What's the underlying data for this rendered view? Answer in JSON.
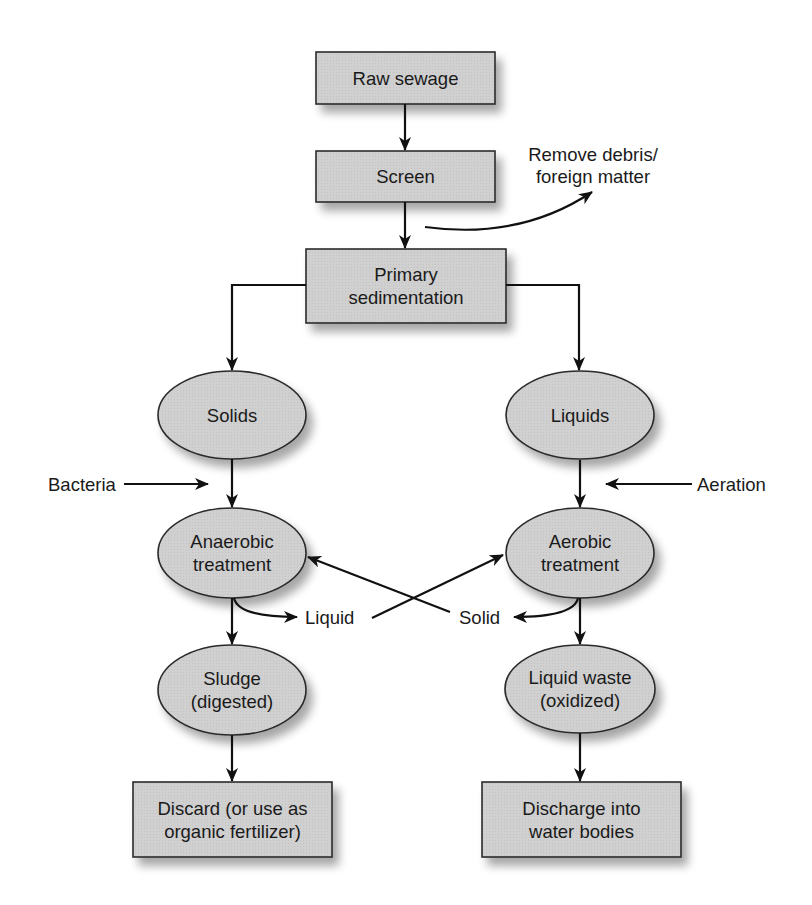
{
  "diagram": {
    "type": "flowchart",
    "title": "",
    "colors": {
      "node_fill": "#cfcfcf",
      "node_stroke": "#2a2a2a",
      "arrow": "#111111",
      "text": "#1a1a1a"
    },
    "nodes": {
      "raw_sewage": {
        "shape": "rect",
        "lines": [
          "Raw sewage"
        ]
      },
      "screen": {
        "shape": "rect",
        "lines": [
          "Screen"
        ]
      },
      "primary": {
        "shape": "rect",
        "lines": [
          "Primary",
          "sedimentation"
        ]
      },
      "solids": {
        "shape": "ellipse",
        "lines": [
          "Solids"
        ]
      },
      "liquids": {
        "shape": "ellipse",
        "lines": [
          "Liquids"
        ]
      },
      "anaerobic": {
        "shape": "ellipse",
        "lines": [
          "Anaerobic",
          "treatment"
        ]
      },
      "aerobic": {
        "shape": "ellipse",
        "lines": [
          "Aerobic",
          "treatment"
        ]
      },
      "sludge": {
        "shape": "ellipse",
        "lines": [
          "Sludge",
          "(digested)"
        ]
      },
      "liquid_waste": {
        "shape": "ellipse",
        "lines": [
          "Liquid waste",
          "(oxidized)"
        ]
      },
      "discard": {
        "shape": "rect",
        "lines": [
          "Discard (or use as",
          "organic fertilizer)"
        ]
      },
      "discharge": {
        "shape": "rect",
        "lines": [
          "Discharge into",
          "water bodies"
        ]
      }
    },
    "labels": {
      "remove_debris": [
        "Remove debris/",
        "foreign matter"
      ],
      "bacteria": "Bacteria",
      "aeration": "Aeration",
      "liquid": "Liquid",
      "solid": "Solid"
    },
    "edges": [
      {
        "from": "raw_sewage",
        "to": "screen"
      },
      {
        "from": "screen",
        "to": "primary"
      },
      {
        "from": "screen",
        "to": "remove_debris",
        "label": "Remove debris/ foreign matter"
      },
      {
        "from": "primary",
        "to": "solids"
      },
      {
        "from": "primary",
        "to": "liquids"
      },
      {
        "from": "solids",
        "to": "anaerobic"
      },
      {
        "from": "bacteria",
        "to": "anaerobic",
        "label": "Bacteria"
      },
      {
        "from": "liquids",
        "to": "aerobic"
      },
      {
        "from": "aeration",
        "to": "aerobic",
        "label": "Aeration"
      },
      {
        "from": "anaerobic",
        "to": "liquid_label",
        "label": "Liquid"
      },
      {
        "from": "liquid_label",
        "to": "aerobic"
      },
      {
        "from": "aerobic",
        "to": "solid_label",
        "label": "Solid"
      },
      {
        "from": "solid_label",
        "to": "anaerobic"
      },
      {
        "from": "anaerobic",
        "to": "sludge"
      },
      {
        "from": "aerobic",
        "to": "liquid_waste"
      },
      {
        "from": "sludge",
        "to": "discard"
      },
      {
        "from": "liquid_waste",
        "to": "discharge"
      }
    ]
  }
}
